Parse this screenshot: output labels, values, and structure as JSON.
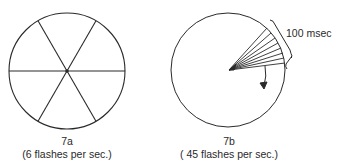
{
  "figure_a": {
    "label": "7a",
    "caption": "(6 flashes per sec.)",
    "spokes": 6
  },
  "figure_b": {
    "label": "7b",
    "caption": "( 45 flashes per sec.)",
    "annotation": "100 msec",
    "fan_lines": 8
  },
  "colors": {
    "stroke": "#2a2a2a",
    "background": "#ffffff"
  }
}
